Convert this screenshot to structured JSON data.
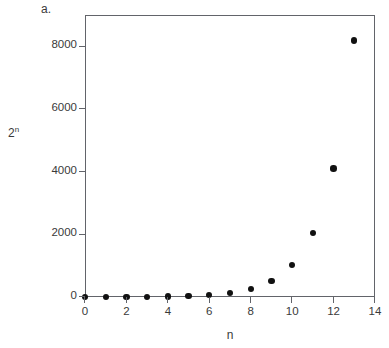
{
  "figure": {
    "panel_label": "a.",
    "background_color": "#ffffff",
    "frame_color": "#62646a",
    "marker_color": "#111111",
    "text_color": "#3a3a3a"
  },
  "chart_data": {
    "type": "scatter",
    "title": "",
    "panel_label": "a.",
    "xlabel": "n",
    "ylabel": "2^n",
    "ylabel_display": "2ⁿ",
    "x": [
      0,
      1,
      2,
      3,
      4,
      5,
      6,
      7,
      8,
      9,
      10,
      11,
      12,
      13
    ],
    "values": [
      1,
      2,
      4,
      8,
      16,
      32,
      64,
      128,
      256,
      512,
      1024,
      2048,
      4096,
      8192
    ],
    "series": [
      {
        "name": "2^n",
        "values": [
          1,
          2,
          4,
          8,
          16,
          32,
          64,
          128,
          256,
          512,
          1024,
          2048,
          4096,
          8192
        ]
      }
    ],
    "xlim": [
      0,
      14
    ],
    "ylim": [
      0,
      9000
    ],
    "xticks": [
      0,
      2,
      4,
      6,
      8,
      10,
      12,
      14
    ],
    "xtick_labels": [
      "0",
      "2",
      "4",
      "6",
      "8",
      "10",
      "12",
      "14"
    ],
    "yticks": [
      0,
      2000,
      4000,
      6000,
      8000
    ],
    "ytick_labels": [
      "0",
      "2000",
      "4000",
      "6000",
      "8000"
    ],
    "grid": false,
    "legend": false,
    "legend_position": "none",
    "marker": "filled-circle",
    "marker_color": "#111111"
  }
}
